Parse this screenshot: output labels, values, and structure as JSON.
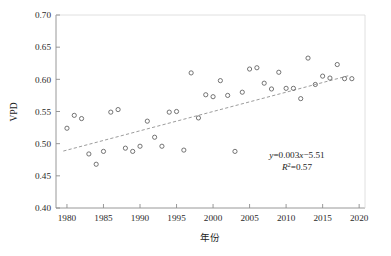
{
  "chart_data": {
    "type": "scatter",
    "title": "",
    "xlabel": "年份",
    "ylabel": "VPD",
    "xlim": [
      1978.5,
      2020.8
    ],
    "ylim": [
      0.4,
      0.7
    ],
    "grid": false,
    "legend": "none",
    "xticks": [
      1980,
      1985,
      1990,
      1995,
      2000,
      2005,
      2010,
      2015,
      2020
    ],
    "xtick_labels": [
      "1980",
      "1985",
      "1990",
      "1995",
      "2000",
      "2005",
      "2010",
      "2015",
      "2020"
    ],
    "yticks": [
      0.4,
      0.45,
      0.5,
      0.55,
      0.6,
      0.65,
      0.7
    ],
    "ytick_labels": [
      "0.40",
      "0.45",
      "0.50",
      "0.55",
      "0.60",
      "0.65",
      "0.70"
    ],
    "series": [
      {
        "name": "VPD",
        "marker": "open-circle",
        "x": [
          1980,
          1981,
          1982,
          1983,
          1984,
          1985,
          1986,
          1987,
          1988,
          1989,
          1990,
          1991,
          1992,
          1993,
          1994,
          1995,
          1996,
          1997,
          1998,
          1999,
          2000,
          2001,
          2002,
          2003,
          2004,
          2005,
          2006,
          2007,
          2008,
          2009,
          2010,
          2011,
          2012,
          2013,
          2014,
          2015,
          2016,
          2017,
          2018,
          2019
        ],
        "values": [
          0.524,
          0.544,
          0.539,
          0.484,
          0.468,
          0.488,
          0.549,
          0.553,
          0.493,
          0.488,
          0.496,
          0.535,
          0.51,
          0.496,
          0.549,
          0.55,
          0.49,
          0.61,
          0.54,
          0.576,
          0.573,
          0.598,
          0.575,
          0.488,
          0.58,
          0.616,
          0.618,
          0.594,
          0.585,
          0.611,
          0.586,
          0.586,
          0.57,
          0.633,
          0.592,
          0.605,
          0.602,
          0.623,
          0.601,
          0.601
        ]
      }
    ],
    "trendline": {
      "name": "linear-fit",
      "style": "dashed",
      "slope": 0.003,
      "intercept": -5.51,
      "x_start": 1979.5,
      "x_end": 2018.5,
      "y_start": 0.4885,
      "y_end": 0.6055,
      "equation": "y=0.003x−5.51",
      "equation_y": "y",
      "equation_body": "=0.003",
      "equation_x": "x",
      "equation_tail": "−5.51",
      "r2_symbol": "R",
      "r2_sup": "2",
      "r2_value": "=0.57",
      "r2": 0.57
    }
  },
  "annotations": {
    "equation_label": "y=0.003x−5.51",
    "r2_label": "R²=0.57"
  }
}
